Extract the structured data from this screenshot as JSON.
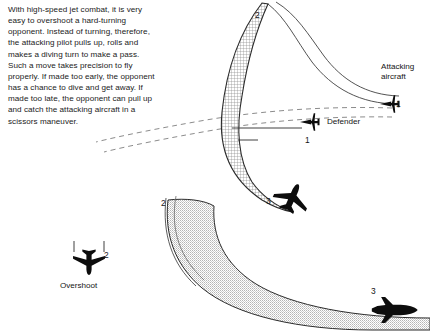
{
  "figure": {
    "caption": "With high-speed jet combat, it is very easy to overshoot a hard-turning opponent. Instead of turning, therefore, the attacking pilot pulls up, rolls and makes a diving turn to make a pass. Such a move takes precision to fly properly. If made too early, the opponent has a chance to dive and get away. If made too late, the opponent can pull up and catch the attacking aircraft in a scissors maneuver."
  },
  "labels": {
    "attacking_aircraft": "Attacking\naircraft",
    "attacking_aircraft_line1": "Attacking",
    "attacking_aircraft_line2": "aircraft",
    "defender": "Defender",
    "overshoot": "Overshoot"
  },
  "position_markers": {
    "attacker_start": "1",
    "defender_start": "1",
    "attacker_apex": "2",
    "defender_turn": "2",
    "overshoot_point": "2",
    "attacker_pass": "3",
    "defender_end": "3"
  },
  "icons": {
    "attacking_aircraft_icon": "jet-front-view-icon",
    "defender_icon": "jet-front-view-icon",
    "overshoot_icon": "jet-top-view-icon",
    "attacker_banking_icon": "jet-banking-icon",
    "defender_side_icon": "jet-side-view-icon"
  },
  "colors": {
    "ink": "#141414",
    "attacker_ribbon_fill": "#c9c9c9",
    "defender_ribbon_fill": "#d8d8d8",
    "line": "#3a3a3a",
    "background": "#ffffff"
  }
}
